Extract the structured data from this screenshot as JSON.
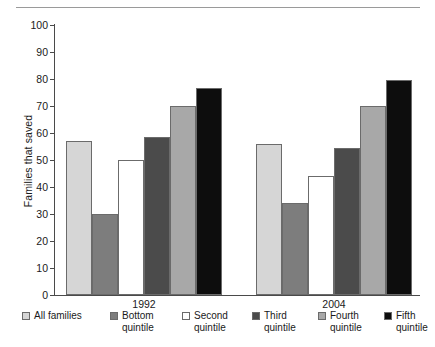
{
  "chart_data": {
    "type": "bar",
    "title": "",
    "subtitle": "",
    "xlabel": "",
    "ylabel": "Families that saved",
    "categories": [
      "1992",
      "2004"
    ],
    "ylim": [
      0,
      100
    ],
    "yticks": [
      0,
      10,
      20,
      30,
      40,
      50,
      60,
      70,
      80,
      90,
      100
    ],
    "ytick_labels": [
      "0",
      "10",
      "20",
      "30",
      "40",
      "50",
      "60",
      "70",
      "80",
      "90",
      "100"
    ],
    "grid": false,
    "legend_position": "bottom",
    "series": [
      {
        "name": "All families",
        "label_line1": "All families",
        "label_line2": "",
        "color": "#d6d6d6",
        "values": [
          57,
          56
        ]
      },
      {
        "name": "Bottom quintile",
        "label_line1": "Bottom",
        "label_line2": "quintile",
        "color": "#7d7d7d",
        "values": [
          30,
          34
        ]
      },
      {
        "name": "Second quintile",
        "label_line1": "Second",
        "label_line2": "quintile",
        "color": "#ffffff",
        "values": [
          50,
          44
        ]
      },
      {
        "name": "Third quintile",
        "label_line1": "Third",
        "label_line2": "quintile",
        "color": "#4b4b4b",
        "values": [
          58.5,
          54.5
        ]
      },
      {
        "name": "Fourth quintile",
        "label_line1": "Fourth",
        "label_line2": "quintile",
        "color": "#a8a8a8",
        "values": [
          70,
          70
        ]
      },
      {
        "name": "Fifth quintile",
        "label_line1": "Fifth",
        "label_line2": "quintile",
        "color": "#0d0d0d",
        "values": [
          76.5,
          79.5
        ]
      }
    ]
  },
  "axis": {
    "y_title": "Families that saved",
    "group_labels": [
      "1992",
      "2004"
    ]
  },
  "legend": {
    "items": [
      {
        "line1": "All families",
        "line2": ""
      },
      {
        "line1": "Bottom",
        "line2": "quintile"
      },
      {
        "line1": "Second",
        "line2": "quintile"
      },
      {
        "line1": "Third",
        "line2": "quintile"
      },
      {
        "line1": "Fourth",
        "line2": "quintile"
      },
      {
        "line1": "Fifth",
        "line2": "quintile"
      }
    ]
  },
  "colors": {
    "all_families": "#d6d6d6",
    "bottom_quintile": "#7d7d7d",
    "second_quintile": "#ffffff",
    "third_quintile": "#4b4b4b",
    "fourth_quintile": "#a8a8a8",
    "fifth_quintile": "#0d0d0d",
    "axis": "#4a4a4a",
    "rule": "#9a9a9a"
  }
}
